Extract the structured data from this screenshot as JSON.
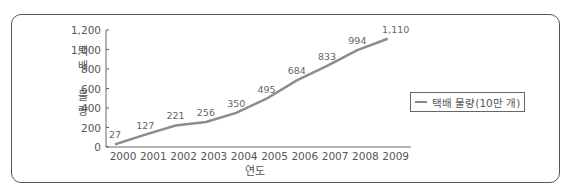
{
  "chart_data": {
    "type": "line",
    "title": "",
    "xlabel": "연도",
    "ylabel": "택배 물량",
    "ylim": [
      0,
      1200
    ],
    "yticks": [
      "0",
      "200",
      "400",
      "600",
      "800",
      "1,000",
      "1,200"
    ],
    "categories": [
      "2000",
      "2001",
      "2002",
      "2003",
      "2004",
      "2005",
      "2006",
      "2007",
      "2008",
      "2009"
    ],
    "series": [
      {
        "name": "택배 물량(10만 개)",
        "values": [
          27,
          127,
          221,
          256,
          350,
          495,
          684,
          833,
          994,
          1110
        ],
        "labels": [
          "27",
          "127",
          "221",
          "256",
          "350",
          "495",
          "684",
          "833",
          "994",
          "1,110"
        ],
        "color": "#8c8c8c"
      }
    ],
    "grid": false,
    "legend_position": "right"
  },
  "legend": {
    "label": "택배 물량(10만 개)"
  },
  "axes": {
    "x_title": "연도",
    "y_title": [
      "택",
      "배",
      "",
      "물",
      "량"
    ]
  }
}
